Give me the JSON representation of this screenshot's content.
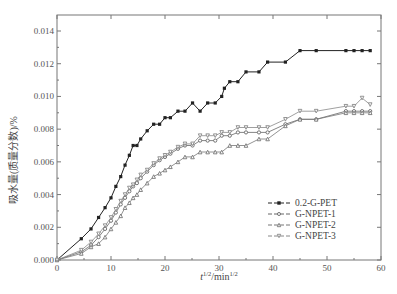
{
  "chart_data": {
    "type": "line",
    "title": "",
    "xlabel": "t^1/2/min^1/2",
    "xlabel_main": "t",
    "xlabel_sup1": "1/2",
    "xlabel_mid": "/min",
    "xlabel_sup2": "1/2",
    "ylabel": "吸水量(质量分数)/%",
    "xlim": [
      0,
      60
    ],
    "ylim": [
      0,
      0.0148
    ],
    "x_ticks": [
      0,
      10,
      20,
      30,
      40,
      50,
      60
    ],
    "x_tick_labels": [
      "0",
      "10",
      "20",
      "30",
      "40",
      "50",
      "60"
    ],
    "y_ticks": [
      0,
      0.002,
      0.004,
      0.006,
      0.008,
      0.01,
      0.012,
      0.014
    ],
    "y_tick_labels": [
      "0.000",
      "0.002",
      "0.004",
      "0.006",
      "0.008",
      "0.010",
      "0.012",
      "0.014"
    ],
    "grid": false,
    "legend_position": "lower right",
    "series": [
      {
        "name": "0.2-G-PET",
        "marker": "square",
        "color": "#222222",
        "x": [
          0,
          4.5,
          6.3,
          7.7,
          8.9,
          10.0,
          10.9,
          11.8,
          12.6,
          13.4,
          14.1,
          14.8,
          15.5,
          16.7,
          17.9,
          19.0,
          20.0,
          21.0,
          22.4,
          23.7,
          25.1,
          26.5,
          27.9,
          29.3,
          30.5,
          31.0,
          32.0,
          33.5,
          35.0,
          37.4,
          39.0,
          42.3,
          45.0,
          48.0,
          53.5,
          55.0,
          56.5,
          58.0
        ],
        "y": [
          0,
          0.0013,
          0.0019,
          0.0026,
          0.0032,
          0.0038,
          0.0045,
          0.0051,
          0.0058,
          0.0064,
          0.007,
          0.007,
          0.0074,
          0.0079,
          0.0083,
          0.0083,
          0.0087,
          0.0087,
          0.0091,
          0.0091,
          0.0096,
          0.0091,
          0.0096,
          0.0096,
          0.01,
          0.0105,
          0.0109,
          0.0109,
          0.0115,
          0.0115,
          0.0121,
          0.0121,
          0.0128,
          0.0128,
          0.0128,
          0.0128,
          0.0128,
          0.0128
        ]
      },
      {
        "name": "G-NPET-1",
        "marker": "circle",
        "color": "#666666",
        "x": [
          0,
          4.5,
          6.3,
          7.7,
          8.9,
          10.0,
          10.9,
          11.8,
          12.6,
          13.4,
          14.1,
          14.8,
          15.5,
          16.7,
          17.9,
          19.0,
          20.0,
          21.0,
          22.4,
          23.7,
          25.1,
          26.5,
          27.9,
          29.3,
          30.5,
          32.0,
          33.5,
          35.0,
          37.4,
          39.0,
          42.3,
          45.0,
          48.0,
          53.5,
          55.0,
          56.5,
          58.0
        ],
        "y": [
          0,
          0.0005,
          0.0009,
          0.0014,
          0.0019,
          0.0024,
          0.0029,
          0.0034,
          0.0038,
          0.0042,
          0.0045,
          0.0047,
          0.005,
          0.0054,
          0.0058,
          0.0061,
          0.0063,
          0.0065,
          0.0068,
          0.007,
          0.007,
          0.0073,
          0.0073,
          0.0073,
          0.0076,
          0.0076,
          0.0078,
          0.0078,
          0.0078,
          0.0078,
          0.0083,
          0.0086,
          0.0086,
          0.0091,
          0.0091,
          0.0091,
          0.0091
        ]
      },
      {
        "name": "G-NPET-2",
        "marker": "triangle-up",
        "color": "#777777",
        "x": [
          0,
          4.5,
          6.3,
          7.7,
          8.9,
          10.0,
          10.9,
          11.8,
          12.6,
          13.4,
          14.1,
          14.8,
          15.5,
          16.7,
          17.9,
          19.0,
          20.0,
          21.0,
          22.4,
          23.7,
          25.1,
          26.5,
          27.9,
          29.3,
          30.5,
          32.0,
          33.5,
          35.0,
          37.4,
          39.0,
          42.3,
          45.0,
          48.0,
          53.5,
          55.0,
          56.5,
          58.0
        ],
        "y": [
          0,
          0.0004,
          0.0008,
          0.001,
          0.0014,
          0.0019,
          0.0023,
          0.0027,
          0.0032,
          0.0035,
          0.0038,
          0.004,
          0.0043,
          0.0047,
          0.0051,
          0.0053,
          0.0055,
          0.0057,
          0.006,
          0.0063,
          0.0063,
          0.0066,
          0.0066,
          0.0066,
          0.0066,
          0.007,
          0.007,
          0.007,
          0.0074,
          0.0074,
          0.0082,
          0.0086,
          0.0086,
          0.009,
          0.009,
          0.009,
          0.009
        ]
      },
      {
        "name": "G-NPET-3",
        "marker": "triangle-down",
        "color": "#888888",
        "x": [
          0,
          4.5,
          6.3,
          7.7,
          8.9,
          10.0,
          10.9,
          11.8,
          12.6,
          13.4,
          14.1,
          14.8,
          15.5,
          16.7,
          17.9,
          19.0,
          20.0,
          21.0,
          22.4,
          23.7,
          25.1,
          26.5,
          27.9,
          29.3,
          30.5,
          32.0,
          33.5,
          35.0,
          37.4,
          39.0,
          42.3,
          45.0,
          48.0,
          53.5,
          55.0,
          56.5,
          58.0
        ],
        "y": [
          0,
          0.0006,
          0.0011,
          0.0016,
          0.0021,
          0.0026,
          0.0031,
          0.0036,
          0.004,
          0.0044,
          0.0046,
          0.0049,
          0.0052,
          0.0055,
          0.0059,
          0.0062,
          0.0064,
          0.0066,
          0.0069,
          0.0071,
          0.0071,
          0.0076,
          0.0076,
          0.0076,
          0.0078,
          0.0078,
          0.0081,
          0.0081,
          0.0081,
          0.0081,
          0.0086,
          0.0091,
          0.0091,
          0.0094,
          0.0094,
          0.0099,
          0.0095
        ]
      }
    ]
  }
}
